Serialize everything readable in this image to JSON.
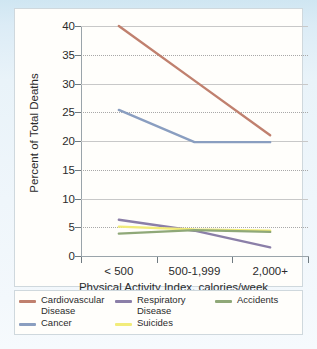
{
  "chart_data": {
    "type": "line",
    "title": "",
    "xlabel": "Physical Activity Index, calories/week",
    "ylabel": "Percent of Total Deaths",
    "categories": [
      "< 500",
      "500-1,999",
      "2,000+"
    ],
    "ylim": [
      0,
      40
    ],
    "yticks": [
      0,
      5,
      10,
      15,
      20,
      25,
      30,
      35,
      40
    ],
    "grid": "horizontal dotted",
    "legend_position": "below plot",
    "series": [
      {
        "name": "Cardiovascular Disease",
        "values": [
          40.0,
          30.5,
          21.0
        ],
        "color": "#c0806e"
      },
      {
        "name": "Cancer",
        "values": [
          25.4,
          19.8,
          19.8
        ],
        "color": "#8a9ec0"
      },
      {
        "name": "Respiratory Disease",
        "values": [
          6.3,
          4.4,
          1.5
        ],
        "color": "#8b7fa8"
      },
      {
        "name": "Suicides",
        "values": [
          5.1,
          4.6,
          4.4
        ],
        "color": "#f2ec7a"
      },
      {
        "name": "Accidents",
        "values": [
          3.9,
          4.5,
          4.2
        ],
        "color": "#8fa878"
      }
    ]
  },
  "legend": {
    "items": [
      {
        "label": "Cardiovascular\nDisease",
        "color": "#c0806e"
      },
      {
        "label": "Respiratory\nDisease",
        "color": "#8b7fa8"
      },
      {
        "label": "Accidents",
        "color": "#8fa878"
      },
      {
        "label": "Cancer",
        "color": "#8a9ec0"
      },
      {
        "label": "Suicides",
        "color": "#f2ec7a"
      }
    ]
  }
}
